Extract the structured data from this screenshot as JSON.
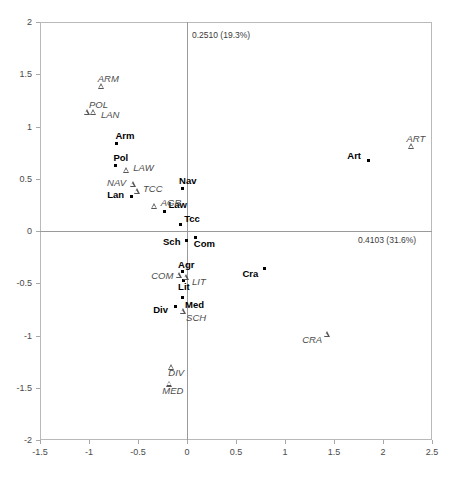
{
  "chart_data": {
    "type": "scatter",
    "title": "",
    "xlabel": "0.4103 (31.6%)",
    "ylabel": "0.2510 (19.3%)",
    "xlim": [
      -1.5,
      2.5
    ],
    "ylim": [
      -2,
      2
    ],
    "xticks": [
      "-1.5",
      "-1",
      "-0.5",
      "0",
      "0.5",
      "1",
      "1.5",
      "2",
      "2.5"
    ],
    "xtick_values": [
      -1.5,
      -1,
      -0.5,
      0,
      0.5,
      1,
      1.5,
      2,
      2.5
    ],
    "yticks": [
      "2",
      "1.5",
      "1",
      "0.5",
      "0",
      "-0.5",
      "-1",
      "-1.5",
      "-2"
    ],
    "ytick_values": [
      2,
      1.5,
      1,
      0.5,
      0,
      -0.5,
      -1,
      -1.5,
      -2
    ],
    "grid": false,
    "legend": "none",
    "series": [
      {
        "name": "row-points",
        "marker": "filled-square-dot",
        "label_style": "bold-upright",
        "points": [
          {
            "label": "Arm",
            "x": -0.72,
            "y": 0.84,
            "label_dx": -1,
            "label_dy": -12
          },
          {
            "label": "Pol",
            "x": -0.73,
            "y": 0.63,
            "label_dx": -2,
            "label_dy": -12
          },
          {
            "label": "Nav",
            "x": -0.05,
            "y": 0.41,
            "label_dx": -3,
            "label_dy": -12
          },
          {
            "label": "Lan",
            "x": -0.57,
            "y": 0.33,
            "label_dx": -24,
            "label_dy": -7
          },
          {
            "label": "Law",
            "x": -0.23,
            "y": 0.19,
            "label_dx": 4,
            "label_dy": -11
          },
          {
            "label": "Tcc",
            "x": -0.07,
            "y": 0.06,
            "label_dx": 4,
            "label_dy": -11
          },
          {
            "label": "Art",
            "x": 1.85,
            "y": 0.67,
            "label_dx": -21,
            "label_dy": -10
          },
          {
            "label": "Sch",
            "x": -0.01,
            "y": -0.09,
            "label_dx": -23,
            "label_dy": -3
          },
          {
            "label": "Com",
            "x": 0.09,
            "y": -0.06,
            "label_dx": -2,
            "label_dy": 2
          },
          {
            "label": "Agr",
            "x": -0.05,
            "y": -0.39,
            "label_dx": -4,
            "label_dy": -12
          },
          {
            "label": "Lit",
            "x": -0.04,
            "y": -0.47,
            "label_dx": -5,
            "label_dy": 2
          },
          {
            "label": "Med",
            "x": -0.05,
            "y": -0.64,
            "label_dx": 3,
            "label_dy": 2
          },
          {
            "label": "Div",
            "x": -0.12,
            "y": -0.72,
            "label_dx": -22,
            "label_dy": -1
          },
          {
            "label": "Cra",
            "x": 0.79,
            "y": -0.36,
            "label_dx": -22,
            "label_dy": 0
          }
        ]
      },
      {
        "name": "column-points",
        "marker": "open-triangle",
        "label_style": "italic",
        "points": [
          {
            "label": "ARM",
            "x": -0.87,
            "y": 1.39,
            "label_dx": -4,
            "label_dy": -12
          },
          {
            "label": "POL",
            "x": -1.02,
            "y": 1.14,
            "label_dx": 2,
            "label_dy": -12
          },
          {
            "label": "LAN",
            "x": -0.95,
            "y": 1.14,
            "label_dx": 7,
            "label_dy": -2
          },
          {
            "label": "LAW",
            "x": -0.62,
            "y": 0.58,
            "label_dx": 7,
            "label_dy": -7
          },
          {
            "label": "NAV",
            "x": -0.55,
            "y": 0.45,
            "label_dx": -26,
            "label_dy": -6
          },
          {
            "label": "TCC",
            "x": -0.51,
            "y": 0.38,
            "label_dx": 6,
            "label_dy": -7
          },
          {
            "label": "AGR",
            "x": -0.33,
            "y": 0.24,
            "label_dx": 6,
            "label_dy": -8
          },
          {
            "label": "ART",
            "x": 2.29,
            "y": 0.81,
            "label_dx": -5,
            "label_dy": -12
          },
          {
            "label": "COM",
            "x": -0.08,
            "y": -0.42,
            "label_dx": -28,
            "label_dy": -4
          },
          {
            "label": "LIT",
            "x": -0.01,
            "y": -0.44,
            "label_dx": 6,
            "label_dy": 0
          },
          {
            "label": "SCH",
            "x": -0.04,
            "y": -0.77,
            "label_dx": 3,
            "label_dy": 2
          },
          {
            "label": "CRA",
            "x": 1.43,
            "y": -0.99,
            "label_dx": -25,
            "label_dy": 1
          },
          {
            "label": "DIV",
            "x": -0.16,
            "y": -1.3,
            "label_dx": -3,
            "label_dy": 1
          },
          {
            "label": "MED",
            "x": -0.18,
            "y": -1.46,
            "label_dx": -7,
            "label_dy": 2
          }
        ]
      }
    ]
  },
  "colors": {
    "frame": "#b9b9b9",
    "axis": "#9a9a9a",
    "row_marker": "#000000",
    "col_marker": "#555555",
    "tick_text": "#4a4a4a"
  }
}
